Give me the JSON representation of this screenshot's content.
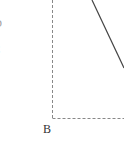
{
  "diagram": {
    "type": "geometry-figure-fragment",
    "labels": {
      "vertex_b": "B",
      "left_edge_mark_1": "D",
      "left_edge_mark_2": "C"
    },
    "colors": {
      "dashed_line": "#888888",
      "solid_line": "#444444",
      "label": "#333333",
      "background": "#ffffff"
    },
    "lines": {
      "dashed_vertical": {
        "x1": 52.5,
        "y1": 0,
        "x2": 52.5,
        "y2": 118.5
      },
      "dashed_horizontal": {
        "x1": 52.5,
        "y1": 118.5,
        "x2": 124,
        "y2": 118.5
      },
      "solid_diagonal": {
        "x1": 92,
        "y1": 0,
        "x2": 124,
        "y2": 68
      }
    }
  }
}
